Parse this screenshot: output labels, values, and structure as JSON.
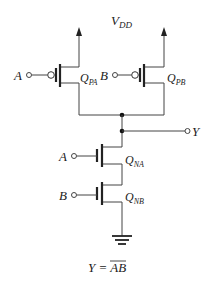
{
  "supply": {
    "label": "V",
    "sub": "DD"
  },
  "inputs": {
    "a": "A",
    "b": "B"
  },
  "output": {
    "label": "Y"
  },
  "transistors": {
    "qpa": {
      "q": "Q",
      "sub": "PA",
      "type": "PMOS"
    },
    "qpb": {
      "q": "Q",
      "sub": "PB",
      "type": "PMOS"
    },
    "qna": {
      "q": "Q",
      "sub": "NA",
      "type": "NMOS"
    },
    "qnb": {
      "q": "Q",
      "sub": "NB",
      "type": "NMOS"
    }
  },
  "equation": {
    "lhs": "Y =",
    "rhs": "AB"
  },
  "colors": {
    "line": "#444444",
    "text": "#222222",
    "background": "#ffffff"
  }
}
